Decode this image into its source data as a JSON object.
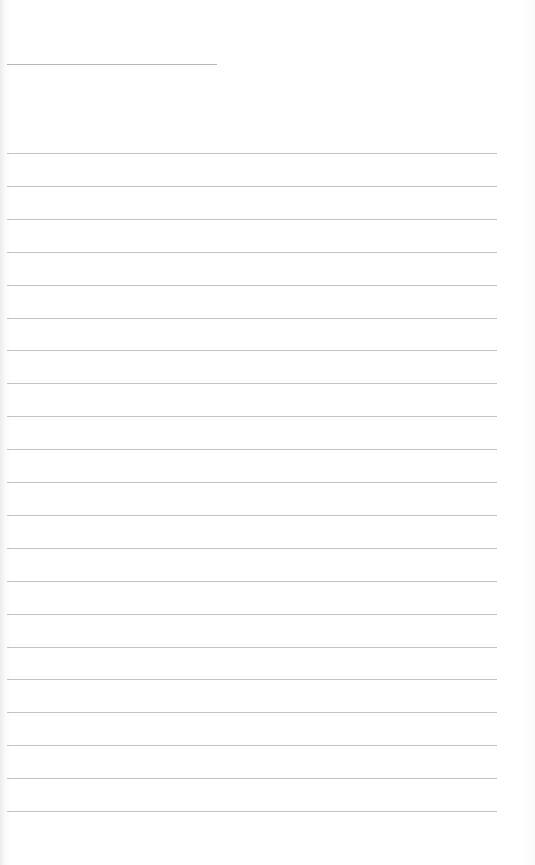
{
  "page": {
    "type": "blank lined notebook page",
    "title_line": {
      "visible": true,
      "filled_text": ""
    },
    "ruled_lines": {
      "count": 21,
      "first_y": 153,
      "spacing": 32.9,
      "color": "#c4c4c4",
      "entries": [
        "",
        "",
        "",
        "",
        "",
        "",
        "",
        "",
        "",
        "",
        "",
        "",
        "",
        "",
        "",
        "",
        "",
        "",
        "",
        "",
        ""
      ]
    },
    "background_color": "#ffffff"
  }
}
